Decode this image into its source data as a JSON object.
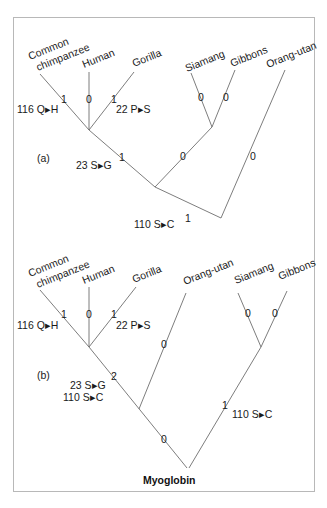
{
  "figure": {
    "caption": "Myoglobin",
    "panels": [
      {
        "label": "(a)",
        "taxa": [
          "Common chimpanzee",
          "Human",
          "Gorilla",
          "Siamang",
          "Gibbons",
          "Orang-utan"
        ],
        "taxa_lines": {
          "chimp_1": "Common",
          "chimp_2": "chimpanzee",
          "human": "Human",
          "gorilla": "Gorilla",
          "siamang": "Siamang",
          "gibbons": "Gibbons",
          "orang": "Orang-utan"
        },
        "branch_counts": {
          "chimp": "1",
          "human": "0",
          "gorilla": "1",
          "siamang": "0",
          "gibbons": "0",
          "orang": "0",
          "african_ape_stem": "1",
          "hylobatid_stem": "0",
          "great_ape_stem": "1"
        },
        "substitutions": {
          "chimp": "116 Q▸H",
          "gorilla": "22 P▸S",
          "african_ape_stem": "23 S▸G",
          "great_ape_stem": "110 S▸C"
        }
      },
      {
        "label": "(b)",
        "taxa": [
          "Common chimpanzee",
          "Human",
          "Gorilla",
          "Orang-utan",
          "Siamang",
          "Gibbons"
        ],
        "taxa_lines": {
          "chimp_1": "Common",
          "chimp_2": "chimpanzee",
          "human": "Human",
          "gorilla": "Gorilla",
          "orang": "Orang-utan",
          "siamang": "Siamang",
          "gibbons": "Gibbons"
        },
        "branch_counts": {
          "chimp": "1",
          "human": "0",
          "gorilla": "1",
          "orang": "0",
          "siamang": "0",
          "gibbons": "0",
          "african_ape_stem": "2",
          "great_ape_stem": "0",
          "hylobatid_stem": "1"
        },
        "substitutions": {
          "chimp": "116 Q▸H",
          "gorilla": "22 P▸S",
          "african_ape_stem_1": "23 S▸G",
          "african_ape_stem_2": "110 S▸C",
          "hylobatid_stem": "110 S▸C"
        }
      }
    ]
  },
  "colors": {
    "line": "#6e6e6e",
    "text": "#1a1a1a",
    "frame": "#b8b8b8"
  }
}
